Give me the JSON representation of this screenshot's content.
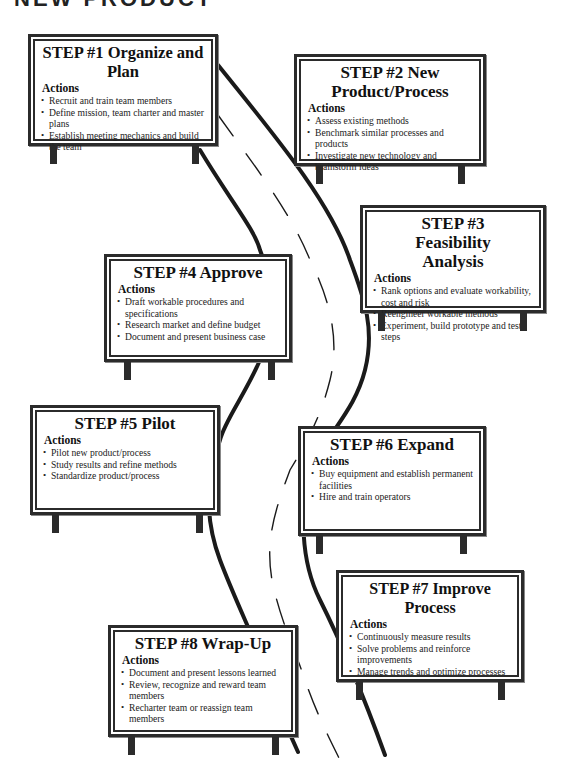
{
  "page": {
    "title_fragment": "NEW PRODUCT"
  },
  "actions_label": "Actions",
  "steps": [
    {
      "title": "STEP #1 Organize and Plan",
      "items": [
        "Recruit and train team members",
        "Define mission, team charter and master plans",
        "Establish meeting mechanics and build the team"
      ]
    },
    {
      "title": "STEP #2 New Product/Process",
      "items": [
        "Assess existing methods",
        "Benchmark similar processes and products",
        "Investigate new technology and brainstorm ideas"
      ]
    },
    {
      "title": "STEP #3 Feasibility Analysis",
      "items": [
        "Rank options and evaluate workability, cost and risk",
        "Reengineer workable methods",
        "Experiment, build prototype and test steps"
      ]
    },
    {
      "title": "STEP #4 Approve",
      "items": [
        "Draft workable procedures and specifications",
        "Research market and define budget",
        "Document and present business case"
      ]
    },
    {
      "title": "STEP #5 Pilot",
      "items": [
        "Pilot new product/process",
        "Study results and refine methods",
        "Standardize product/process"
      ]
    },
    {
      "title": "STEP #6 Expand",
      "items": [
        "Buy equipment and establish permanent facilities",
        "Hire and train operators"
      ]
    },
    {
      "title": "STEP #7 Improve Process",
      "items": [
        "Continuously measure results",
        "Solve problems and reinforce improvements",
        "Manage trends and optimize processes"
      ]
    },
    {
      "title": "STEP #8 Wrap-Up",
      "items": [
        "Document and present lessons learned",
        "Review, recognize and reward team members",
        "Recharter team or reassign team members"
      ]
    }
  ],
  "colors": {
    "ink": "#2b2b2b",
    "background": "#ffffff"
  }
}
